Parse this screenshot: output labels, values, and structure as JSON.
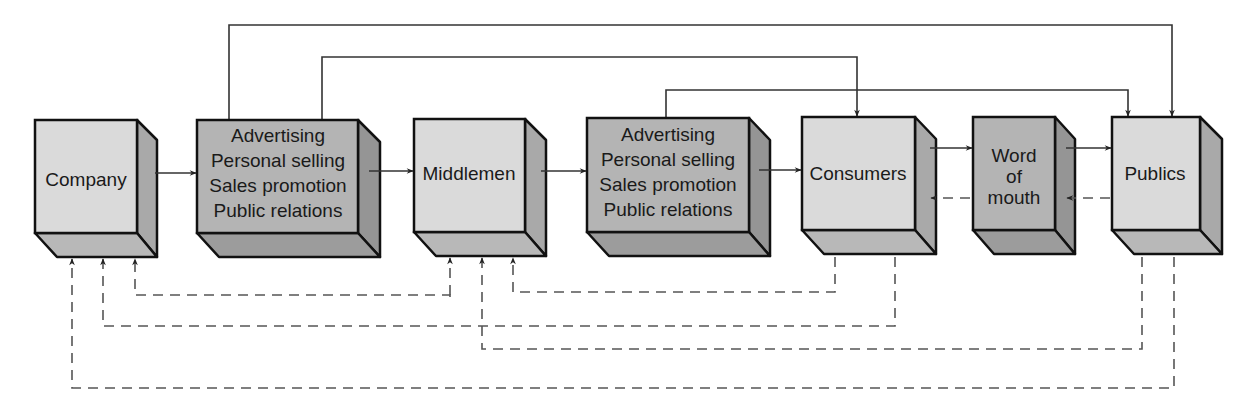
{
  "colors": {
    "light_front": "#dadada",
    "light_side": "#a9a9a9",
    "light_bottom": "#b8b8b8",
    "dark_front": "#b4b4b4",
    "dark_side": "#959595",
    "dark_bottom": "#9c9c9c",
    "stroke": "#111111",
    "line": "#333333",
    "dash": "#555555"
  },
  "boxes": [
    {
      "id": "company",
      "lines": [
        "Company"
      ]
    },
    {
      "id": "promo1",
      "lines": [
        "Advertising",
        "Personal selling",
        "Sales promotion",
        "Public relations"
      ]
    },
    {
      "id": "middlemen",
      "lines": [
        "Middlemen"
      ]
    },
    {
      "id": "promo2",
      "lines": [
        "Advertising",
        "Personal selling",
        "Sales promotion",
        "Public relations"
      ]
    },
    {
      "id": "consumers",
      "lines": [
        "Consumers"
      ]
    },
    {
      "id": "word_of_mouth",
      "lines": [
        "Word",
        "of",
        "mouth"
      ]
    },
    {
      "id": "publics",
      "lines": [
        "Publics"
      ]
    }
  ]
}
